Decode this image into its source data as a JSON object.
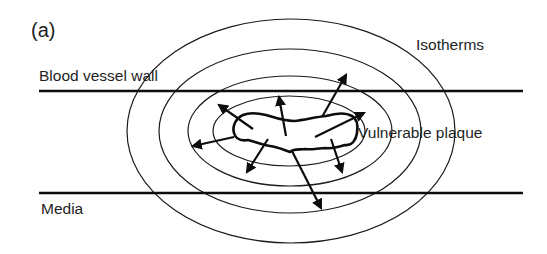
{
  "figure": {
    "panel_label": "(a)",
    "labels": {
      "vessel_wall": "Blood vessel wall",
      "isotherms": "Isotherms",
      "plaque": "Vulnerable plaque",
      "media": "Media"
    },
    "colors": {
      "ink": "#1a1a1a",
      "background": "#ffffff"
    },
    "isotherm_count": 4,
    "heat_flow_arrow_count": 8
  }
}
